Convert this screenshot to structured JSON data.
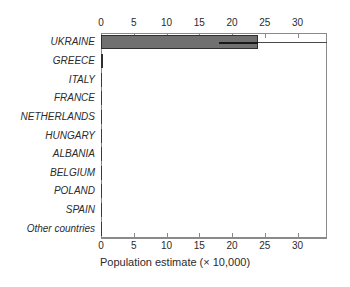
{
  "chart_data": {
    "type": "bar",
    "subtype": "horizontal-boxplot",
    "title": "",
    "xlabel": "Population estimate (× 10,000)",
    "ylabel": "",
    "xlim": [
      0,
      34.5
    ],
    "xticks": [
      0,
      5,
      10,
      15,
      20,
      25,
      30
    ],
    "xtick_labels": [
      "0",
      "5",
      "10",
      "15",
      "20",
      "25",
      "30"
    ],
    "top_axis": true,
    "bottom_axis": true,
    "grid": false,
    "legend": null,
    "categories": [
      "UKRAINE",
      "GREECE",
      "ITALY",
      "FRANCE",
      "NETHERLANDS",
      "HUNGARY",
      "ALBANIA",
      "BELGIUM",
      "POLAND",
      "SPAIN",
      "Other countries"
    ],
    "values": [
      24,
      0.3,
      0,
      0,
      0,
      0,
      0,
      0,
      0,
      0,
      0
    ],
    "boxes": [
      {
        "category": "UKRAINE",
        "low": 0,
        "high": 24,
        "median": 18,
        "whisker_high": 34.5
      },
      {
        "category": "GREECE",
        "low": 0,
        "high": 0.3,
        "median": null,
        "whisker_high": null
      },
      {
        "category": "ITALY",
        "low": 0,
        "high": 0,
        "median": null,
        "whisker_high": null
      },
      {
        "category": "FRANCE",
        "low": 0,
        "high": 0,
        "median": null,
        "whisker_high": null
      },
      {
        "category": "NETHERLANDS",
        "low": 0,
        "high": 0,
        "median": null,
        "whisker_high": null
      },
      {
        "category": "HUNGARY",
        "low": 0,
        "high": 0,
        "median": null,
        "whisker_high": null
      },
      {
        "category": "ALBANIA",
        "low": 0,
        "high": 0,
        "median": null,
        "whisker_high": null
      },
      {
        "category": "BELGIUM",
        "low": 0,
        "high": 0,
        "median": null,
        "whisker_high": null
      },
      {
        "category": "POLAND",
        "low": 0,
        "high": 0,
        "median": null,
        "whisker_high": null
      },
      {
        "category": "SPAIN",
        "low": 0,
        "high": 0,
        "median": null,
        "whisker_high": null
      },
      {
        "category": "Other countries",
        "low": 0,
        "high": 0,
        "median": null,
        "whisker_high": null
      }
    ],
    "colors": {
      "box_fill": "#707070",
      "box_edge": "#2f2f2f",
      "median": "#1a1a1a",
      "whisker": "#4a4a4a",
      "axis": "#8a8a8a",
      "text": "#2b2b2b",
      "background": "#ffffff"
    }
  }
}
